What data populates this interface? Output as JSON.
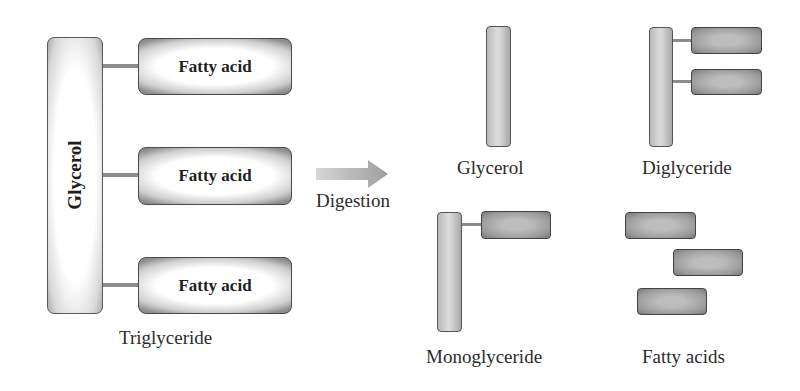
{
  "diagram": {
    "colors": {
      "outline": "#4a4a4a",
      "connector": "#8c8c8c",
      "fatty_acid_fill": "#9a9a9a",
      "glycerol_fill": "#d0d0d0",
      "arrow": "#b0b0b0"
    },
    "triglyceride": {
      "glycerol_label": "Glycerol",
      "fatty_acids": [
        {
          "label": "Fatty acid"
        },
        {
          "label": "Fatty acid"
        },
        {
          "label": "Fatty acid"
        }
      ],
      "caption": "Triglyceride"
    },
    "arrow": {
      "icon": "right-arrow-icon",
      "label": "Digestion"
    },
    "products": [
      {
        "name": "glycerol",
        "caption": "Glycerol",
        "fatty_acid_count": 0
      },
      {
        "name": "diglyceride",
        "caption": "Diglyceride",
        "fatty_acid_count": 2
      },
      {
        "name": "monoglyceride",
        "caption": "Monoglyceride",
        "fatty_acid_count": 1
      },
      {
        "name": "fatty-acids",
        "caption": "Fatty acids",
        "fatty_acid_count": 3
      }
    ]
  }
}
